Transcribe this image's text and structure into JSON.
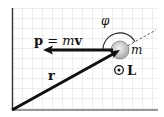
{
  "figure": {
    "labels": {
      "momentum_p": "p",
      "momentum_eq": " = ",
      "momentum_m": "m",
      "momentum_v": "v",
      "position": "r",
      "angle": "φ",
      "mass": "m",
      "angular_momentum": "L"
    },
    "colors": {
      "background": "#ffffff",
      "grid": "#d8d8d8",
      "axes": "#333333",
      "vector": "#111111",
      "particle_fill": "#cfcfcf",
      "particle_highlight": "#f2f2f2"
    },
    "icons": {
      "out_of_page": "dot-in-circle"
    }
  }
}
